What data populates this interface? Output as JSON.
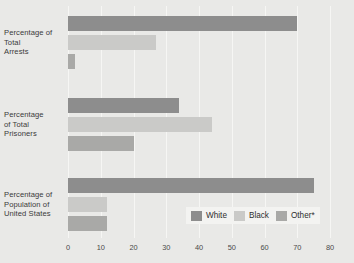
{
  "chart_data": {
    "type": "bar",
    "orientation": "horizontal",
    "title": "",
    "xlabel": "",
    "ylabel": "",
    "xlim": [
      0,
      80
    ],
    "xticks": [
      0,
      10,
      20,
      30,
      40,
      50,
      60,
      70,
      80
    ],
    "xtick_labels": [
      "0",
      "10",
      "20",
      "30",
      "40",
      "50",
      "60",
      "70",
      "80"
    ],
    "grid": true,
    "legend_position": "bottom-right",
    "categories": [
      "Percentage of Total Arrests",
      "Percentage of Total Prisoners",
      "Percentage of Population of United States"
    ],
    "category_label_lines": [
      [
        "Percentage of",
        "Total",
        "Arrests"
      ],
      [
        "Percentage",
        "of Total",
        "Prisoners"
      ],
      [
        "Percentage of",
        "Population of",
        "United States"
      ]
    ],
    "series": [
      {
        "name": "White",
        "color": "#8d8d8d",
        "values": [
          70,
          34,
          75
        ]
      },
      {
        "name": "Black",
        "color": "#cacac8",
        "values": [
          27,
          44,
          12
        ]
      },
      {
        "name": "Other*",
        "color": "#a9a9a7",
        "values": [
          2,
          20,
          12
        ]
      }
    ]
  },
  "legend": {
    "items": [
      {
        "label": "White",
        "color": "#8d8d8d"
      },
      {
        "label": "Black",
        "color": "#cacac8"
      },
      {
        "label": "Other*",
        "color": "#a9a9a7"
      }
    ]
  },
  "colors": {
    "background": "#e9e9e7",
    "gridline": "#f6f6f4",
    "legend_background": "#f3f3f1",
    "text": "#3a3a3a"
  }
}
